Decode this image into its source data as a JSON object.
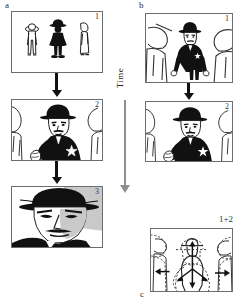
{
  "figure": {
    "caption_labels": {
      "a": "a",
      "b": "b",
      "c": "c"
    },
    "time_axis": {
      "label": "Time",
      "direction": "downward",
      "arrow_icon": "down-arrow-icon"
    }
  },
  "column_a": {
    "label": "a",
    "panels": [
      {
        "number": "1",
        "shot": "wide shot",
        "description": "Three full-body figures standing: a pale bystander at left, a black-suited man with a hat at center, and a pale figure at right"
      },
      {
        "number": "2",
        "shot": "medium shot",
        "description": "Black-suited man with hat and sheriff star badge, hand raised near hip, flanked by partial bystanders"
      },
      {
        "number": "3",
        "shot": "close-up",
        "description": "Extreme close-up of the man's face under the brim of the hat, shoulders in black"
      }
    ],
    "transitions": [
      {
        "from": "1",
        "to": "2",
        "icon": "down-arrow-icon"
      },
      {
        "from": "2",
        "to": "3",
        "icon": "down-arrow-icon"
      }
    ]
  },
  "column_b": {
    "label": "b",
    "panels": [
      {
        "number": "1",
        "shot": "medium-wide shot",
        "description": "Black-suited man with hat standing between two large foreground bystanders seen from behind"
      },
      {
        "number": "2",
        "shot": "medium shot",
        "description": "Black-suited man with hat and star badge, hand raised near hip, bystanders at frame edges"
      }
    ],
    "transitions": [
      {
        "from": "1",
        "to": "2",
        "icon": "down-arrow-icon"
      }
    ]
  },
  "panel_c": {
    "label": "c",
    "number": "1+2",
    "description": "Superimposition of shots 1 and 2 with motion vectors: solid outline of shot 1 overlaid with dashed outline of shot 2, arrows showing expansion outward and downward",
    "arrows": [
      {
        "name": "up-arrow-center",
        "direction": "up"
      },
      {
        "name": "down-arrow-center",
        "direction": "down"
      },
      {
        "name": "left-arrow-outer",
        "direction": "left"
      },
      {
        "name": "right-arrow-outer",
        "direction": "right"
      },
      {
        "name": "left-arrow-inner",
        "direction": "left"
      },
      {
        "name": "right-arrow-inner",
        "direction": "right"
      }
    ]
  },
  "colors": {
    "ink": "#111111",
    "frame": "#6d6d6d",
    "time_axis": "#8e8e8e",
    "paper": "#ffffff"
  }
}
